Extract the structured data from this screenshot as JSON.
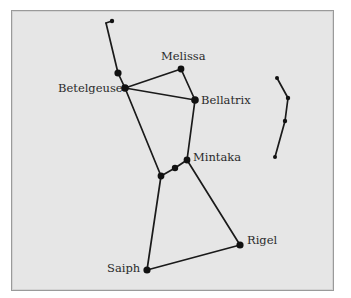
{
  "diagram": {
    "colors": {
      "background": "#e6e6e6",
      "frame_border": "#9a9a9a",
      "line": "#1a1a1a",
      "star": "#111111",
      "label": "#2a2a2a"
    },
    "stars": [
      {
        "id": "club_tip",
        "x": 112,
        "y": 21,
        "r": 2.2
      },
      {
        "id": "club_hook",
        "x": 106,
        "y": 23,
        "r": 0
      },
      {
        "id": "shoulder_upper",
        "x": 118,
        "y": 73,
        "r": 3.6
      },
      {
        "id": "betelgeuse",
        "name": "Betelgeuse",
        "x": 125,
        "y": 88,
        "r": 3.8
      },
      {
        "id": "melissa",
        "name": "Melissa",
        "x": 181,
        "y": 69,
        "r": 3.4
      },
      {
        "id": "bellatrix",
        "name": "Bellatrix",
        "x": 195,
        "y": 100,
        "r": 3.8
      },
      {
        "id": "mintaka",
        "name": "Mintaka",
        "x": 187,
        "y": 160,
        "r": 3.4
      },
      {
        "id": "alnilam",
        "x": 175,
        "y": 168,
        "r": 3.2
      },
      {
        "id": "alnitak",
        "x": 161,
        "y": 176,
        "r": 3.4
      },
      {
        "id": "rigel",
        "name": "Rigel",
        "x": 240,
        "y": 245,
        "r": 3.6
      },
      {
        "id": "saiph",
        "name": "Saiph",
        "x": 147,
        "y": 270,
        "r": 3.6
      },
      {
        "id": "shield_1",
        "x": 277,
        "y": 78,
        "r": 2.0
      },
      {
        "id": "shield_2",
        "x": 288,
        "y": 98,
        "r": 2.2
      },
      {
        "id": "shield_3",
        "x": 285,
        "y": 121,
        "r": 2.2
      },
      {
        "id": "shield_4",
        "x": 275,
        "y": 157,
        "r": 2.0
      }
    ],
    "edges": [
      [
        "club_tip",
        "club_hook"
      ],
      [
        "club_hook",
        "shoulder_upper"
      ],
      [
        "shoulder_upper",
        "betelgeuse"
      ],
      [
        "betelgeuse",
        "melissa"
      ],
      [
        "melissa",
        "bellatrix"
      ],
      [
        "betelgeuse",
        "bellatrix"
      ],
      [
        "bellatrix",
        "mintaka"
      ],
      [
        "betelgeuse",
        "alnitak"
      ],
      [
        "alnitak",
        "alnilam"
      ],
      [
        "alnilam",
        "mintaka"
      ],
      [
        "mintaka",
        "rigel"
      ],
      [
        "alnitak",
        "saiph"
      ],
      [
        "saiph",
        "rigel"
      ],
      [
        "shield_1",
        "shield_2"
      ],
      [
        "shield_2",
        "shield_3"
      ],
      [
        "shield_3",
        "shield_4"
      ]
    ],
    "labels": [
      {
        "id": "melissa",
        "text": "Melissa",
        "x": 161,
        "y": 51
      },
      {
        "id": "betelgeuse",
        "text": "Betelgeuse",
        "x": 58,
        "y": 83
      },
      {
        "id": "bellatrix",
        "text": "Bellatrix",
        "x": 201,
        "y": 95
      },
      {
        "id": "mintaka",
        "text": "Mintaka",
        "x": 193,
        "y": 152
      },
      {
        "id": "rigel",
        "text": "Rigel",
        "x": 247,
        "y": 235
      },
      {
        "id": "saiph",
        "text": "Saiph",
        "x": 107,
        "y": 263
      }
    ]
  }
}
